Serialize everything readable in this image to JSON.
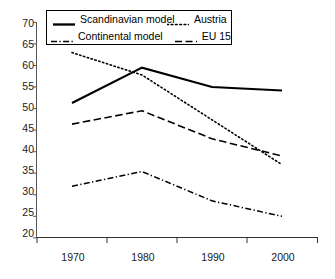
{
  "chart_data": {
    "type": "line",
    "title": "",
    "xlabel": "",
    "ylabel": "",
    "categories": [
      "1970",
      "1980",
      "1990",
      "2000"
    ],
    "x": [
      1970,
      1980,
      1990,
      2000
    ],
    "xlim": [
      1965,
      2005
    ],
    "ylim": [
      20,
      70
    ],
    "yticks": [
      20,
      25,
      30,
      35,
      40,
      45,
      50,
      55,
      60,
      65,
      70
    ],
    "ytick_labels": [
      "20",
      "25",
      "30",
      "35",
      "40",
      "45",
      "50",
      "55",
      "60",
      "65",
      "70"
    ],
    "grid": false,
    "legend_position": "top-center",
    "series": [
      {
        "name": "Scandinavian model",
        "style": "solid",
        "color": "#000000",
        "values": [
          51.3,
          59.5,
          55.0,
          54.2
        ]
      },
      {
        "name": "Austria",
        "style": "dotted",
        "color": "#000000",
        "values": [
          63.0,
          57.8,
          47.4,
          37.0
        ]
      },
      {
        "name": "Continental model",
        "style": "dash-dot",
        "color": "#000000",
        "values": [
          32.0,
          35.4,
          28.6,
          25.0
        ]
      },
      {
        "name": "EU 15",
        "style": "dashed",
        "color": "#000000",
        "values": [
          46.4,
          49.5,
          43.0,
          39.0
        ]
      }
    ]
  },
  "legend": {
    "entries": [
      {
        "label": "Scandinavian model",
        "style": "solid"
      },
      {
        "label": "Austria",
        "style": "dotted"
      },
      {
        "label": "Continental model",
        "style": "dash-dot"
      },
      {
        "label": "EU 15",
        "style": "dashed"
      }
    ]
  },
  "axes": {
    "y_labels": [
      "70",
      "65",
      "60",
      "55",
      "50",
      "45",
      "40",
      "35",
      "30",
      "25",
      "20"
    ],
    "x_labels": [
      "1970",
      "1980",
      "1990",
      "2000"
    ]
  }
}
